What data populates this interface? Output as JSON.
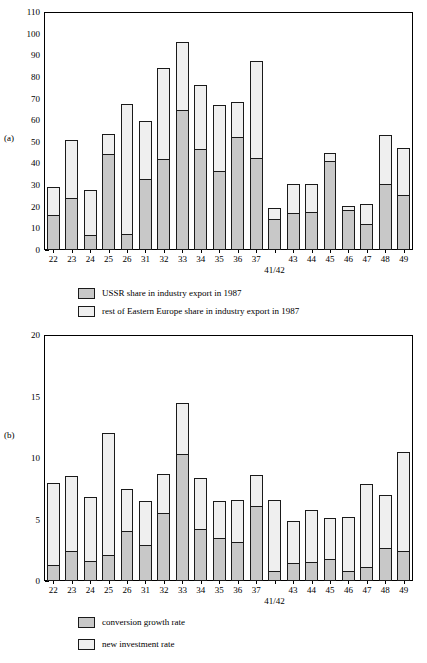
{
  "figure": {
    "panels": [
      {
        "id": "a",
        "panel_label": "(a)"
      },
      {
        "id": "b",
        "panel_label": "(b)"
      }
    ]
  },
  "chart_data": [
    {
      "type": "bar",
      "id": "panel-a",
      "title": "",
      "subplot_label": "(a)",
      "stacked": true,
      "xlabel": "41/42",
      "ylabel": "",
      "ylim": [
        0,
        110
      ],
      "yticks": [
        0,
        10,
        20,
        30,
        40,
        50,
        60,
        70,
        80,
        90,
        100,
        110
      ],
      "grid": false,
      "legend_position": "below-axes",
      "categories": [
        "22",
        "23",
        "24",
        "25",
        "26",
        "31",
        "32",
        "33",
        "34",
        "35",
        "36",
        "37",
        "41/42",
        "43",
        "44",
        "45",
        "46",
        "47",
        "48",
        "49"
      ],
      "series": [
        {
          "name": "USSR share in industry export in 1987",
          "values": [
            16.2,
            24.0,
            6.8,
            44.3,
            7.3,
            32.7,
            42.0,
            64.8,
            46.8,
            36.5,
            52.3,
            42.5,
            14.2,
            17.3,
            17.5,
            41.0,
            18.3,
            12.0,
            30.5,
            25.5
          ]
        },
        {
          "name": "rest of Eastern Europe share in industry export in 1987",
          "values": [
            13.0,
            26.8,
            21.0,
            9.4,
            60.2,
            26.8,
            42.0,
            31.5,
            29.5,
            30.7,
            16.3,
            45.0,
            5.2,
            13.0,
            13.0,
            4.0,
            2.0,
            9.2,
            22.8,
            21.8
          ]
        }
      ],
      "totals": [
        29.2,
        50.8,
        27.8,
        53.7,
        67.5,
        59.5,
        84.0,
        96.3,
        76.3,
        67.2,
        68.6,
        87.5,
        19.4,
        30.3,
        30.5,
        45.0,
        20.3,
        21.2,
        53.3,
        47.3
      ]
    },
    {
      "type": "bar",
      "id": "panel-b",
      "title": "",
      "subplot_label": "(b)",
      "stacked": true,
      "xlabel": "41/42",
      "ylabel": "",
      "ylim": [
        0,
        20
      ],
      "yticks": [
        0,
        5,
        10,
        15,
        20
      ],
      "grid": false,
      "legend_position": "below-axes",
      "categories": [
        "22",
        "23",
        "24",
        "25",
        "26",
        "31",
        "32",
        "33",
        "34",
        "35",
        "36",
        "37",
        "41/42",
        "43",
        "44",
        "45",
        "46",
        "47",
        "48",
        "49"
      ],
      "series": [
        {
          "name": "conversion growth rate",
          "values": [
            1.3,
            2.4,
            1.6,
            2.1,
            4.1,
            2.9,
            5.5,
            10.3,
            4.2,
            3.5,
            3.2,
            6.1,
            0.85,
            1.45,
            1.55,
            1.75,
            0.85,
            1.15,
            2.65,
            2.45
          ]
        },
        {
          "name": "new investment rate",
          "values": [
            6.7,
            6.1,
            5.2,
            9.9,
            3.4,
            3.6,
            3.2,
            4.2,
            4.2,
            3.0,
            3.4,
            2.5,
            5.75,
            3.45,
            4.2,
            3.35,
            4.35,
            6.75,
            4.35,
            8.05
          ]
        }
      ],
      "totals": [
        8.0,
        8.5,
        6.8,
        12.0,
        7.5,
        6.5,
        8.7,
        14.5,
        8.4,
        6.5,
        6.6,
        8.6,
        6.6,
        4.9,
        5.75,
        5.1,
        5.2,
        7.9,
        7.0,
        10.5
      ]
    }
  ],
  "panel_a": {
    "label": "(a)",
    "yticks": [
      "110",
      "100",
      "90",
      "80",
      "70",
      "60",
      "50",
      "40",
      "30",
      "20",
      "10",
      "0"
    ],
    "xticks": [
      "22",
      "23",
      "24",
      "25",
      "26",
      "31",
      "32",
      "33",
      "34",
      "35",
      "36",
      "37",
      "",
      "43",
      "44",
      "45",
      "46",
      "47",
      "48",
      "49"
    ],
    "xaxis_title": "41/42",
    "legend": [
      {
        "label": "USSR share in industry export in 1987",
        "swatch": "lower"
      },
      {
        "label": "rest of Eastern Europe share in industry export in 1987",
        "swatch": "upper"
      }
    ]
  },
  "panel_b": {
    "label": "(b)",
    "yticks": [
      "20",
      "15",
      "10",
      "5",
      "0"
    ],
    "xticks": [
      "22",
      "23",
      "24",
      "25",
      "26",
      "31",
      "32",
      "33",
      "34",
      "35",
      "36",
      "37",
      "",
      "43",
      "44",
      "45",
      "46",
      "47",
      "48",
      "49"
    ],
    "xaxis_title": "41/42",
    "legend": [
      {
        "label": "conversion growth rate",
        "swatch": "lower"
      },
      {
        "label": "new investment rate",
        "swatch": "upper"
      }
    ]
  }
}
